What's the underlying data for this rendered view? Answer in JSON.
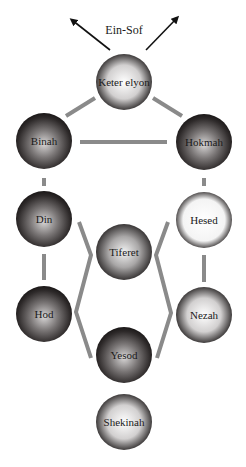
{
  "diagram": {
    "title": "Ein-Sof",
    "colors": {
      "connector": "#8a8a8a",
      "arrow": "#111111",
      "dark_sphere_edge": "#1e1a1a",
      "light_sphere_edge": "#3a3838"
    },
    "arrows": [
      {
        "direction": "up-left",
        "x1": 110,
        "y1": 50,
        "x2": 72,
        "y2": 20
      },
      {
        "direction": "up-right",
        "x1": 146,
        "y1": 50,
        "x2": 177,
        "y2": 18
      }
    ],
    "nodes": [
      {
        "id": "keter",
        "label": "Keter elyon",
        "cx": 124,
        "cy": 82,
        "r": 28,
        "tone": "light"
      },
      {
        "id": "binah",
        "label": "Binah",
        "cx": 44,
        "cy": 141,
        "r": 28,
        "tone": "dark"
      },
      {
        "id": "hokmah",
        "label": "Hokmah",
        "cx": 204,
        "cy": 142,
        "r": 28,
        "tone": "dark"
      },
      {
        "id": "din",
        "label": "Din",
        "cx": 44,
        "cy": 219,
        "r": 28,
        "tone": "dark"
      },
      {
        "id": "hesed",
        "label": "Hesed",
        "cx": 204,
        "cy": 220,
        "r": 28,
        "tone": "white"
      },
      {
        "id": "tiferet",
        "label": "Tiferet",
        "cx": 124,
        "cy": 252,
        "r": 28,
        "tone": "medium"
      },
      {
        "id": "hod",
        "label": "Hod",
        "cx": 44,
        "cy": 314,
        "r": 28,
        "tone": "dark"
      },
      {
        "id": "nezah",
        "label": "Nezah",
        "cx": 204,
        "cy": 315,
        "r": 28,
        "tone": "light"
      },
      {
        "id": "yesod",
        "label": "Yesod",
        "cx": 124,
        "cy": 355,
        "r": 28,
        "tone": "dark"
      },
      {
        "id": "shekinah",
        "label": "Shekinah",
        "cx": 124,
        "cy": 422,
        "r": 28,
        "tone": "light"
      }
    ],
    "connectors": [
      {
        "from": "keter",
        "to": "binah",
        "points": "95,98 66,116"
      },
      {
        "from": "keter",
        "to": "hokmah",
        "points": "153,98 182,116"
      },
      {
        "from": "binah",
        "to": "hokmah",
        "points": "80,142 167,142"
      },
      {
        "from": "binah",
        "to": "din",
        "points": "44,178 44,186"
      },
      {
        "from": "hokmah",
        "to": "hesed",
        "points": "204,178 204,186"
      },
      {
        "from": "din",
        "to": "hod",
        "points": "44,254 44,280"
      },
      {
        "from": "hesed",
        "to": "nezah",
        "points": "204,255 204,282"
      },
      {
        "from": "din-tiferet-hod-yesod",
        "to": "left-chevron",
        "points": "79,222 91,255 76,312 91,358"
      },
      {
        "from": "hesed-tiferet-nezah-yesod",
        "to": "right-chevron",
        "points": "168,222 156,255 171,313 157,358"
      }
    ]
  }
}
